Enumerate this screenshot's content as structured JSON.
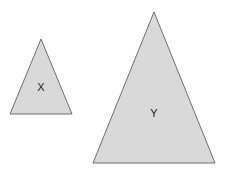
{
  "diagram": {
    "background": "#ffffff",
    "fill_color": "#d9d9d9",
    "stroke_color": "#6f6f6f",
    "shapes": [
      {
        "type": "triangle",
        "label": "X",
        "points": "41,39 72,114 10,114",
        "label_x": 41,
        "label_y": 91
      },
      {
        "type": "triangle",
        "label": "Y",
        "points": "154,12 215,163 93,163",
        "label_x": 154,
        "label_y": 117
      }
    ]
  }
}
